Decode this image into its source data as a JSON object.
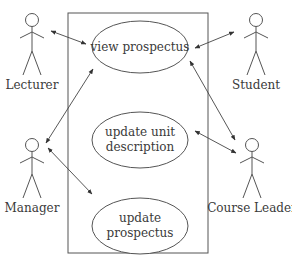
{
  "diagram": {
    "type": "uml-use-case",
    "colors": {
      "stroke": "#555555",
      "text": "#3a3a3a",
      "background": "#ffffff"
    },
    "system_boundary": {
      "x": 68,
      "y": 13,
      "width": 140,
      "height": 240
    },
    "use_cases": [
      {
        "id": "view_prospectus",
        "label_lines": [
          "view prospectus"
        ],
        "cx": 140,
        "cy": 47,
        "rx": 48,
        "ry": 26
      },
      {
        "id": "update_unit_description",
        "label_lines": [
          "update unit",
          "description"
        ],
        "cx": 140,
        "cy": 140,
        "rx": 48,
        "ry": 28
      },
      {
        "id": "update_prospectus",
        "label_lines": [
          "update",
          "prospectus"
        ],
        "cx": 140,
        "cy": 226,
        "rx": 48,
        "ry": 28
      }
    ],
    "actors": [
      {
        "id": "lecturer",
        "label": "Lecturer",
        "x": 32,
        "head_y": 20
      },
      {
        "id": "student",
        "label": "Student",
        "x": 258,
        "head_y": 20
      },
      {
        "id": "manager",
        "label": "Manager",
        "x": 32,
        "head_y": 145
      },
      {
        "id": "course_leader",
        "label": "Course Leader",
        "x": 258,
        "head_y": 145
      }
    ],
    "associations": [
      {
        "from": "lecturer",
        "to": "view_prospectus",
        "bidirectional": true
      },
      {
        "from": "student",
        "to": "view_prospectus",
        "bidirectional": true
      },
      {
        "from": "manager",
        "to": "view_prospectus",
        "bidirectional": true
      },
      {
        "from": "manager",
        "to": "update_prospectus",
        "bidirectional": true
      },
      {
        "from": "course_leader",
        "to": "view_prospectus",
        "bidirectional": true
      },
      {
        "from": "course_leader",
        "to": "update_unit_description",
        "bidirectional": true
      }
    ]
  },
  "labels": {
    "uc_view_prospectus": "view prospectus",
    "uc_update_unit_line1": "update unit",
    "uc_update_unit_line2": "description",
    "uc_update_prospectus_line1": "update",
    "uc_update_prospectus_line2": "prospectus",
    "actor_lecturer": "Lecturer",
    "actor_student": "Student",
    "actor_manager": "Manager",
    "actor_course_leader": "Course Leader"
  }
}
